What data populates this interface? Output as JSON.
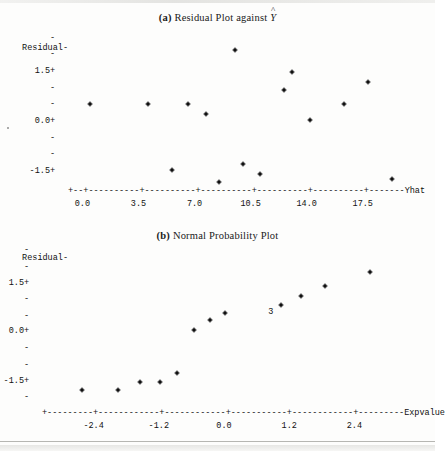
{
  "figure": {
    "background": "#fdfdfc",
    "ink": "#111111"
  },
  "plots": [
    {
      "id": "residual-vs-fitted",
      "title_lead": "(a)",
      "title_text": "Residual Plot against",
      "title_symbol": "Y",
      "title_symbol_accent": "^",
      "ylabel": "Residual-",
      "y_ticks": [
        {
          "value": "1.5",
          "marker": "+"
        },
        {
          "value": "0.0",
          "marker": "+"
        },
        {
          "value": "-1.5",
          "marker": "+"
        }
      ],
      "y_minor_marker": "-",
      "x_axis_label": "Yhat",
      "x_ticks": [
        "0.0",
        "3.5",
        "7.0",
        "10.5",
        "14.0",
        "17.5"
      ],
      "axis_line_char": "-",
      "axis_tick_char": "+"
    },
    {
      "id": "normal-probability",
      "title_lead": "(b)",
      "title_text": "Normal Probability Plot",
      "title_symbol": "",
      "title_symbol_accent": "",
      "ylabel": "Residual-",
      "y_ticks": [
        {
          "value": "1.5",
          "marker": "+"
        },
        {
          "value": "0.0",
          "marker": "+"
        },
        {
          "value": "-1.5",
          "marker": "+"
        }
      ],
      "y_minor_marker": "-",
      "x_axis_label": "Expvalue",
      "x_ticks": [
        "-2.4",
        "-1.2",
        "0.0",
        "1.2",
        "2.4"
      ],
      "axis_line_char": "-",
      "axis_tick_char": "+",
      "overlap_label": "3"
    }
  ],
  "chart_data": [
    {
      "type": "scatter",
      "title": "(a) Residual Plot against Yhat",
      "xlabel": "Yhat",
      "ylabel": "Residual",
      "xlim": [
        -0.9,
        20.2
      ],
      "ylim": [
        -2.6,
        2.6
      ],
      "xticks": [
        0.0,
        3.5,
        7.0,
        10.5,
        14.0,
        17.5
      ],
      "yticks": [
        1.5,
        0.0,
        -1.5
      ],
      "grid": false,
      "legend": null,
      "marker": "*",
      "points": [
        {
          "x": 0.5,
          "y": 0.55
        },
        {
          "x": 4.1,
          "y": 0.55
        },
        {
          "x": 5.6,
          "y": -1.45
        },
        {
          "x": 6.6,
          "y": 0.55
        },
        {
          "x": 7.7,
          "y": 0.25
        },
        {
          "x": 8.5,
          "y": -1.8
        },
        {
          "x": 9.5,
          "y": 2.15
        },
        {
          "x": 10.0,
          "y": -1.25
        },
        {
          "x": 11.1,
          "y": -1.55
        },
        {
          "x": 12.6,
          "y": 0.95
        },
        {
          "x": 13.1,
          "y": 1.5
        },
        {
          "x": 14.2,
          "y": 0.05
        },
        {
          "x": 16.3,
          "y": 0.55
        },
        {
          "x": 17.8,
          "y": 1.2
        },
        {
          "x": 19.3,
          "y": -1.72
        }
      ]
    },
    {
      "type": "scatter",
      "title": "(b) Normal Probability Plot",
      "xlabel": "Expvalue",
      "ylabel": "Residual",
      "xlim": [
        -3.35,
        3.35
      ],
      "ylim": [
        -2.6,
        2.6
      ],
      "xticks": [
        -2.4,
        -1.2,
        0.0,
        1.2,
        2.4
      ],
      "yticks": [
        1.5,
        0.0,
        -1.5
      ],
      "grid": false,
      "legend": null,
      "marker": "*",
      "annotations": [
        {
          "label": "3",
          "x": 0.86,
          "y": 0.62,
          "meaning": "three coincident points"
        }
      ],
      "points": [
        {
          "x": -2.62,
          "y": -1.78
        },
        {
          "x": -1.95,
          "y": -1.78
        },
        {
          "x": -1.55,
          "y": -1.52
        },
        {
          "x": -1.18,
          "y": -1.52
        },
        {
          "x": -0.86,
          "y": -1.25
        },
        {
          "x": -0.55,
          "y": 0.05
        },
        {
          "x": -0.26,
          "y": 0.36
        },
        {
          "x": 0.02,
          "y": 0.58
        },
        {
          "x": 1.05,
          "y": 0.82
        },
        {
          "x": 1.42,
          "y": 1.1
        },
        {
          "x": 1.86,
          "y": 1.42
        },
        {
          "x": 2.68,
          "y": 1.85
        }
      ]
    }
  ]
}
